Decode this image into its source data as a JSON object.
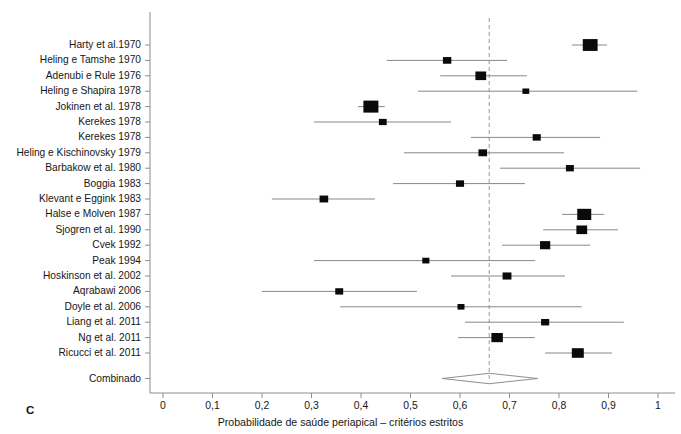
{
  "panel": {
    "letter": "C"
  },
  "axis": {
    "x_title": "Probabilidade de saúde periapical – critérios estritos",
    "x_ticks": [
      "0",
      "0,1",
      "0,2",
      "0,3",
      "0,4",
      "0,5",
      "0,6",
      "0,7",
      "0,8",
      "0,9",
      "1"
    ],
    "x_min": 0,
    "x_max": 1,
    "colors": {
      "axis": "#8c8c8c",
      "marker": "#0a0a0a",
      "line": "#7a7a7a",
      "reference": "#9a9a9a"
    }
  },
  "chart_data": {
    "type": "forest",
    "title": "",
    "xlabel": "Probabilidade de saúde periapical – critérios estritos",
    "ylabel": "",
    "xlim": [
      0,
      1
    ],
    "xticks": [
      0,
      0.1,
      0.2,
      0.3,
      0.4,
      0.5,
      0.6,
      0.7,
      0.8,
      0.9,
      1
    ],
    "grid": false,
    "legend": "none",
    "reference_line": 0.659,
    "reference_line_style": "dashed",
    "effect_measure": "Probability of periapical health (strict criteria)",
    "studies": [
      {
        "label": "Harty et al.1970",
        "estimate": 0.863,
        "ci_low": 0.826,
        "ci_high": 0.897,
        "weight": 0.97
      },
      {
        "label": "Heling e Tamshe 1970",
        "estimate": 0.574,
        "ci_low": 0.452,
        "ci_high": 0.695,
        "weight": 0.2
      },
      {
        "label": "Adenubi e Rule 1976",
        "estimate": 0.642,
        "ci_low": 0.56,
        "ci_high": 0.735,
        "weight": 0.42
      },
      {
        "label": "Heling e Shapira 1978",
        "estimate": 0.733,
        "ci_low": 0.515,
        "ci_high": 0.958,
        "weight": 0.1
      },
      {
        "label": "Jokinen et al. 1978",
        "estimate": 0.42,
        "ci_low": 0.394,
        "ci_high": 0.448,
        "weight": 1.0
      },
      {
        "label": "Kerekes 1978",
        "estimate": 0.444,
        "ci_low": 0.305,
        "ci_high": 0.582,
        "weight": 0.16
      },
      {
        "label": "Kerekes 1978",
        "estimate": 0.755,
        "ci_low": 0.622,
        "ci_high": 0.883,
        "weight": 0.18
      },
      {
        "label": "Heling e Kischinovsky 1979",
        "estimate": 0.646,
        "ci_low": 0.487,
        "ci_high": 0.81,
        "weight": 0.22
      },
      {
        "label": "Barbakow et al. 1980",
        "estimate": 0.822,
        "ci_low": 0.681,
        "ci_high": 0.964,
        "weight": 0.17
      },
      {
        "label": "Boggia 1983",
        "estimate": 0.6,
        "ci_low": 0.465,
        "ci_high": 0.731,
        "weight": 0.18
      },
      {
        "label": "Klevant e Eggink 1983",
        "estimate": 0.325,
        "ci_low": 0.22,
        "ci_high": 0.428,
        "weight": 0.22
      },
      {
        "label": "Halse e Molven 1987",
        "estimate": 0.851,
        "ci_low": 0.806,
        "ci_high": 0.891,
        "weight": 0.84
      },
      {
        "label": "Sjogren et al. 1990",
        "estimate": 0.846,
        "ci_low": 0.768,
        "ci_high": 0.919,
        "weight": 0.42
      },
      {
        "label": "Cvek 1992",
        "estimate": 0.772,
        "ci_low": 0.685,
        "ci_high": 0.863,
        "weight": 0.36
      },
      {
        "label": "Peak 1994",
        "estimate": 0.531,
        "ci_low": 0.305,
        "ci_high": 0.752,
        "weight": 0.12
      },
      {
        "label": "Hoskinson et al. 2002",
        "estimate": 0.695,
        "ci_low": 0.582,
        "ci_high": 0.812,
        "weight": 0.24
      },
      {
        "label": "Aqrabawi 2006",
        "estimate": 0.356,
        "ci_low": 0.2,
        "ci_high": 0.513,
        "weight": 0.17
      },
      {
        "label": "Doyle et al. 2006",
        "estimate": 0.602,
        "ci_low": 0.358,
        "ci_high": 0.846,
        "weight": 0.11
      },
      {
        "label": "Liang et al. 2011",
        "estimate": 0.772,
        "ci_low": 0.61,
        "ci_high": 0.931,
        "weight": 0.18
      },
      {
        "label": "Ng et al. 2011",
        "estimate": 0.675,
        "ci_low": 0.596,
        "ci_high": 0.751,
        "weight": 0.5
      },
      {
        "label": "Ricucci et al. 2011",
        "estimate": 0.838,
        "ci_low": 0.772,
        "ci_high": 0.907,
        "weight": 0.56
      }
    ],
    "summary": {
      "label": "Combinado",
      "estimate": 0.659,
      "ci_low": 0.564,
      "ci_high": 0.757
    }
  }
}
